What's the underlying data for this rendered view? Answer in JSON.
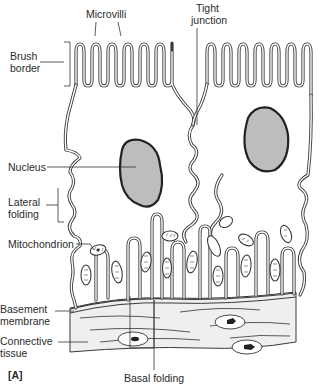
{
  "figure": {
    "panel_label": "[A]",
    "labels": {
      "microvilli": "Microvilli",
      "tight_junction_line1": "Tight",
      "tight_junction_line2": "junction",
      "brush_border_line1": "Brush",
      "brush_border_line2": "border",
      "nucleus": "Nucleus",
      "lateral_folding_line1": "Lateral",
      "lateral_folding_line2": "folding",
      "mitochondrion": "Mitochondrion",
      "basement_membrane_line1": "Basement",
      "basement_membrane_line2": "membrane",
      "connective_tissue_line1": "Connective",
      "connective_tissue_line2": "tissue",
      "basal_folding": "Basal folding"
    },
    "colors": {
      "line": "#3a3a3a",
      "nucleus_fill": "#bdbdbd",
      "connective_fill": "#efefef",
      "background": "#ffffff"
    }
  }
}
